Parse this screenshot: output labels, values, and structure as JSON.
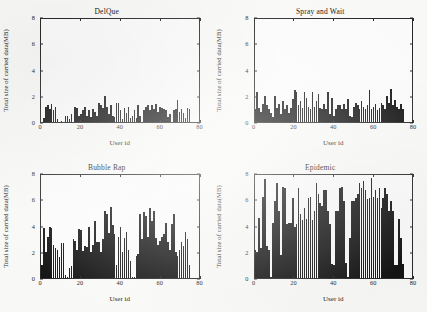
{
  "figure": {
    "background_color": "#fdfdfb",
    "bar_color": "#141414",
    "axis_color": "#2a2a2a"
  },
  "axes_common": {
    "xlabel": "User id",
    "ylabel": "Total size of carried data(MB)",
    "xlim": [
      0,
      80
    ],
    "ylim": [
      0,
      8
    ],
    "xticks": [
      "0",
      "20",
      "40",
      "60",
      "80"
    ],
    "yticks": [
      "0",
      "2",
      "4",
      "6",
      "8"
    ],
    "grid": false
  },
  "chart_data": [
    {
      "type": "bar",
      "title": "DelQue",
      "panel": "top-left",
      "xlabel": "User id",
      "ylabel": "Total size of carried data(MB)",
      "xlim": [
        0,
        80
      ],
      "ylim": [
        0,
        8
      ],
      "xticks": [
        0,
        20,
        40,
        60,
        80
      ],
      "yticks": [
        0,
        2,
        4,
        6,
        8
      ],
      "grid": false,
      "x": [
        1,
        2,
        3,
        4,
        5,
        6,
        7,
        8,
        9,
        10,
        11,
        12,
        13,
        14,
        15,
        16,
        17,
        18,
        19,
        20,
        21,
        22,
        23,
        24,
        25,
        26,
        27,
        28,
        29,
        30,
        31,
        32,
        33,
        34,
        35,
        36,
        37,
        38,
        39,
        40,
        41,
        42,
        43,
        44,
        45,
        46,
        47,
        48,
        49,
        50,
        51,
        52,
        53,
        54,
        55,
        56,
        57,
        58,
        59,
        60,
        61,
        62,
        63,
        64,
        65,
        66,
        67,
        68,
        69,
        70,
        71,
        72,
        73,
        74,
        75,
        76
      ],
      "values": [
        0.0,
        0.3,
        1.2,
        1.3,
        1.0,
        1.4,
        0.9,
        1.2,
        0.2,
        0.0,
        0.1,
        0.0,
        0.5,
        0.5,
        0.2,
        0.6,
        0.0,
        1.2,
        1.1,
        0.5,
        0.6,
        0.9,
        1.2,
        0.5,
        0.9,
        0.4,
        1.0,
        0.8,
        0.5,
        1.5,
        1.3,
        1.1,
        2.0,
        1.2,
        0.6,
        1.3,
        0.5,
        0.4,
        1.5,
        1.5,
        0.9,
        0.2,
        1.1,
        0.7,
        1.2,
        0.3,
        0.5,
        0.9,
        0.3,
        1.3,
        0.5,
        0.0,
        0.9,
        1.2,
        1.3,
        0.9,
        1.3,
        1.0,
        1.4,
        0.8,
        1.2,
        1.1,
        1.0,
        0.9,
        0.4,
        0.6,
        0.0,
        0.9,
        1.0,
        1.7,
        0.8,
        1.0,
        0.7,
        0.3,
        1.1,
        1.0
      ]
    },
    {
      "type": "bar",
      "title": "Spray and Wait",
      "panel": "top-right",
      "xlabel": "User id",
      "ylabel": "Total size of carried data(MB)",
      "xlim": [
        0,
        80
      ],
      "ylim": [
        0,
        8
      ],
      "xticks": [
        0,
        20,
        40,
        60,
        80
      ],
      "yticks": [
        0,
        2,
        4,
        6,
        8
      ],
      "grid": false,
      "x": [
        1,
        2,
        3,
        4,
        5,
        6,
        7,
        8,
        9,
        10,
        11,
        12,
        13,
        14,
        15,
        16,
        17,
        18,
        19,
        20,
        21,
        22,
        23,
        24,
        25,
        26,
        27,
        28,
        29,
        30,
        31,
        32,
        33,
        34,
        35,
        36,
        37,
        38,
        39,
        40,
        41,
        42,
        43,
        44,
        45,
        46,
        47,
        48,
        49,
        50,
        51,
        52,
        53,
        54,
        55,
        56,
        57,
        58,
        59,
        60,
        61,
        62,
        63,
        64,
        65,
        66,
        67,
        68,
        69,
        70,
        71,
        72,
        73,
        74,
        75,
        76
      ],
      "values": [
        1.0,
        2.3,
        1.1,
        0.8,
        1.4,
        2.0,
        1.3,
        1.0,
        0.7,
        0.4,
        2.0,
        1.1,
        1.4,
        0.6,
        1.6,
        1.0,
        1.3,
        0.7,
        1.1,
        1.8,
        2.5,
        2.3,
        1.3,
        1.6,
        1.1,
        2.3,
        1.9,
        1.2,
        1.0,
        2.3,
        1.2,
        1.6,
        2.2,
        1.1,
        1.0,
        1.4,
        1.0,
        2.3,
        0.6,
        1.9,
        0.5,
        1.0,
        1.3,
        1.3,
        1.0,
        1.4,
        1.0,
        1.8,
        0.5,
        0.4,
        1.2,
        1.5,
        1.3,
        1.0,
        1.6,
        1.2,
        1.0,
        1.3,
        2.5,
        1.0,
        1.2,
        1.4,
        0.9,
        1.1,
        1.5,
        1.3,
        1.0,
        2.0,
        1.5,
        2.6,
        1.3,
        1.7,
        1.2,
        1.0,
        1.4,
        1.0
      ]
    },
    {
      "type": "bar",
      "title": "Bubble Rap",
      "panel": "bottom-left",
      "xlabel": "User id",
      "ylabel": "Total size of carried data(MB)",
      "xlim": [
        0,
        80
      ],
      "ylim": [
        0,
        8
      ],
      "xticks": [
        0,
        20,
        40,
        60,
        80
      ],
      "yticks": [
        0,
        2,
        4,
        6,
        8
      ],
      "grid": false,
      "x": [
        1,
        2,
        3,
        4,
        5,
        6,
        7,
        8,
        9,
        10,
        11,
        12,
        13,
        14,
        15,
        16,
        17,
        18,
        19,
        20,
        21,
        22,
        23,
        24,
        25,
        26,
        27,
        28,
        29,
        30,
        31,
        32,
        33,
        34,
        35,
        36,
        37,
        38,
        39,
        40,
        41,
        42,
        43,
        44,
        45,
        46,
        47,
        48,
        49,
        50,
        51,
        52,
        53,
        54,
        55,
        56,
        57,
        58,
        59,
        60,
        61,
        62,
        63,
        64,
        65,
        66,
        67,
        68,
        69,
        70,
        71,
        72,
        73,
        74,
        75,
        76
      ],
      "values": [
        1.0,
        3.9,
        2.0,
        3.2,
        4.0,
        3.9,
        2.6,
        2.3,
        2.2,
        1.6,
        2.7,
        2.7,
        0.2,
        0.1,
        0.8,
        0.9,
        3.0,
        2.9,
        2.2,
        3.8,
        3.7,
        2.1,
        2.5,
        2.4,
        4.0,
        2.0,
        2.6,
        4.4,
        2.8,
        2.8,
        2.0,
        3.0,
        5.2,
        5.0,
        3.5,
        5.5,
        4.1,
        3.4,
        1.0,
        3.2,
        4.0,
        2.0,
        3.1,
        3.6,
        2.2,
        1.3,
        0.1,
        0.1,
        1.7,
        1.9,
        5.0,
        3.0,
        5.1,
        4.8,
        3.2,
        5.4,
        4.4,
        5.2,
        3.1,
        2.6,
        2.9,
        3.2,
        3.4,
        4.3,
        2.8,
        2.2,
        4.2,
        5.0,
        2.0,
        1.7,
        2.2,
        2.8,
        2.5,
        3.6,
        3.0,
        1.0
      ]
    },
    {
      "type": "bar",
      "title": "Epidemic",
      "panel": "bottom-right",
      "xlabel": "User id",
      "ylabel": "Total size of carried data(MB)",
      "xlim": [
        0,
        80
      ],
      "ylim": [
        0,
        8
      ],
      "xticks": [
        0,
        20,
        40,
        60,
        80
      ],
      "yticks": [
        0,
        2,
        4,
        6,
        8
      ],
      "grid": false,
      "x": [
        1,
        2,
        3,
        4,
        5,
        6,
        7,
        8,
        9,
        10,
        11,
        12,
        13,
        14,
        15,
        16,
        17,
        18,
        19,
        20,
        21,
        22,
        23,
        24,
        25,
        26,
        27,
        28,
        29,
        30,
        31,
        32,
        33,
        34,
        35,
        36,
        37,
        38,
        39,
        40,
        41,
        42,
        43,
        44,
        45,
        46,
        47,
        48,
        49,
        50,
        51,
        52,
        53,
        54,
        55,
        56,
        57,
        58,
        59,
        60,
        61,
        62,
        63,
        64,
        65,
        66,
        67,
        68,
        69,
        70,
        71,
        72,
        73,
        74,
        75,
        76
      ],
      "values": [
        2.2,
        2.0,
        4.7,
        2.3,
        6.3,
        7.7,
        2.5,
        2.2,
        0.1,
        4.3,
        6.0,
        7.4,
        5.2,
        1.8,
        7.1,
        7.0,
        4.2,
        4.3,
        4.3,
        6.2,
        4.0,
        4.2,
        7.0,
        5.0,
        4.5,
        5.4,
        4.6,
        6.2,
        6.3,
        4.5,
        5.2,
        7.4,
        6.5,
        5.8,
        5.6,
        6.8,
        6.8,
        5.2,
        4.2,
        1.1,
        1.0,
        5.2,
        5.2,
        7.0,
        7.1,
        6.0,
        1.2,
        0.1,
        3.1,
        6.0,
        6.0,
        6.2,
        6.5,
        7.4,
        7.0,
        7.5,
        6.8,
        6.1,
        6.2,
        7.8,
        6.3,
        6.8,
        6.2,
        7.0,
        5.4,
        6.2,
        7.0,
        6.5,
        5.2,
        6.0,
        5.2,
        1.0,
        1.0,
        4.6,
        3.1,
        1.1
      ]
    }
  ]
}
